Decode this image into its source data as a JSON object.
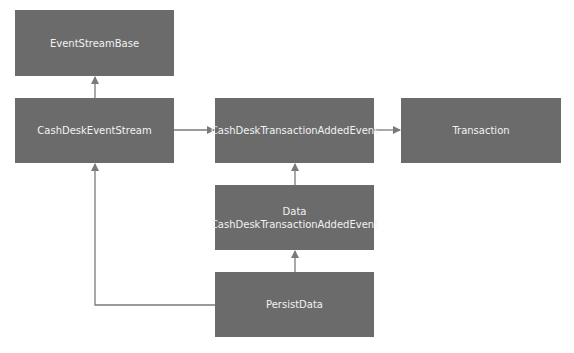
{
  "diagram": {
    "nodes": [
      {
        "id": "event-stream-base",
        "label": "EventStreamBase"
      },
      {
        "id": "cash-desk-event-stream",
        "label": "CashDeskEventStream"
      },
      {
        "id": "cash-desk-transaction-added-event",
        "label": "CashDeskTransactionAddedEvent"
      },
      {
        "id": "transaction",
        "label": "Transaction"
      },
      {
        "id": "data-cash-desk-transaction-added-event",
        "label_line1": "Data",
        "label_line2": "CashDeskTransactionAddedEvent"
      },
      {
        "id": "persist-data",
        "label": "PersistData"
      }
    ],
    "edges": [
      {
        "from": "cash-desk-event-stream",
        "to": "event-stream-base"
      },
      {
        "from": "cash-desk-event-stream",
        "to": "cash-desk-transaction-added-event"
      },
      {
        "from": "cash-desk-transaction-added-event",
        "to": "transaction"
      },
      {
        "from": "data-cash-desk-transaction-added-event",
        "to": "cash-desk-transaction-added-event"
      },
      {
        "from": "persist-data",
        "to": "data-cash-desk-transaction-added-event"
      },
      {
        "from": "persist-data",
        "to": "cash-desk-event-stream"
      }
    ],
    "colors": {
      "node_fill": "#6b6b6b",
      "node_text": "#f2f2f2",
      "edge": "#7a7a7a"
    }
  }
}
